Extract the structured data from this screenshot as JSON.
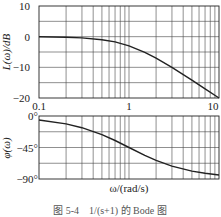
{
  "chart_data": [
    {
      "type": "line",
      "title": "",
      "xlabel": "",
      "ylabel": "L(ω)/dB",
      "xscale": "log",
      "xlim": [
        0.1,
        10
      ],
      "ylim": [
        -20,
        10
      ],
      "yticks": [
        "10",
        "0",
        "-10",
        "-20"
      ],
      "xticks": [
        "0.1",
        "1",
        "10"
      ],
      "grid": true,
      "series": [
        {
          "name": "L(ω)",
          "x": [
            0.1,
            0.2,
            0.3,
            0.5,
            0.7,
            1,
            1.5,
            2,
            3,
            5,
            7,
            10
          ],
          "y": [
            0,
            -0.2,
            -0.4,
            -1.0,
            -1.7,
            -3.0,
            -5.1,
            -7.0,
            -10.0,
            -14.2,
            -17.0,
            -20.0
          ]
        }
      ]
    },
    {
      "type": "line",
      "title": "",
      "xlabel": "ω/(rad/s)",
      "ylabel": "φ(ω)",
      "xscale": "log",
      "xlim": [
        0.1,
        10
      ],
      "ylim": [
        -90,
        0
      ],
      "yticks": [
        "0°",
        "-45°",
        "-90°"
      ],
      "grid": true,
      "series": [
        {
          "name": "φ(ω)",
          "x": [
            0.1,
            0.2,
            0.3,
            0.5,
            0.7,
            1,
            1.5,
            2,
            3,
            5,
            7,
            10
          ],
          "y": [
            -5.7,
            -11.3,
            -16.7,
            -26.6,
            -35.0,
            -45.0,
            -56.3,
            -63.4,
            -71.6,
            -78.7,
            -81.9,
            -84.3
          ]
        }
      ]
    }
  ],
  "labels": {
    "mag_ylabel": "L(ω)/dB",
    "phase_ylabel": "φ(ω)",
    "xlabel": "ω/(rad/s)",
    "mag_yticks": [
      "10",
      "0",
      "−10",
      "−20"
    ],
    "phase_yticks": [
      "0°",
      "−45°",
      "−90°"
    ],
    "xticks": [
      "0.1",
      "1",
      "10"
    ],
    "caption": "图 5-4　1/(s+1) 的 Bode 图"
  }
}
